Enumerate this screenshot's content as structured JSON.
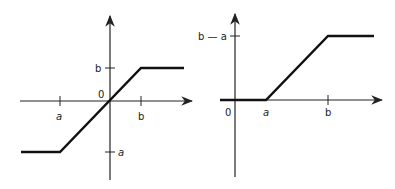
{
  "diagrams": [
    {
      "id": "left",
      "description": "Odd saturation function: -a for x<a, linear through origin, b for x>b",
      "labels": {
        "origin": "0",
        "x_a": "a",
        "x_b": "b",
        "y_b": "b",
        "y_neg_a": "a",
        "y_neg_dash": "-"
      },
      "points": [
        [
          21,
          152
        ],
        [
          60,
          152
        ],
        [
          141,
          68
        ],
        [
          184,
          68
        ]
      ]
    },
    {
      "id": "right",
      "description": "Ramp function: 0 for x<a, linear from a to b, b-a for x>b",
      "labels": {
        "origin": "0",
        "x_a": "a",
        "x_b": "b",
        "y_top": "b — a"
      },
      "points": [
        [
          220,
          100
        ],
        [
          266,
          100
        ],
        [
          328,
          36
        ],
        [
          374,
          36
        ]
      ]
    }
  ]
}
